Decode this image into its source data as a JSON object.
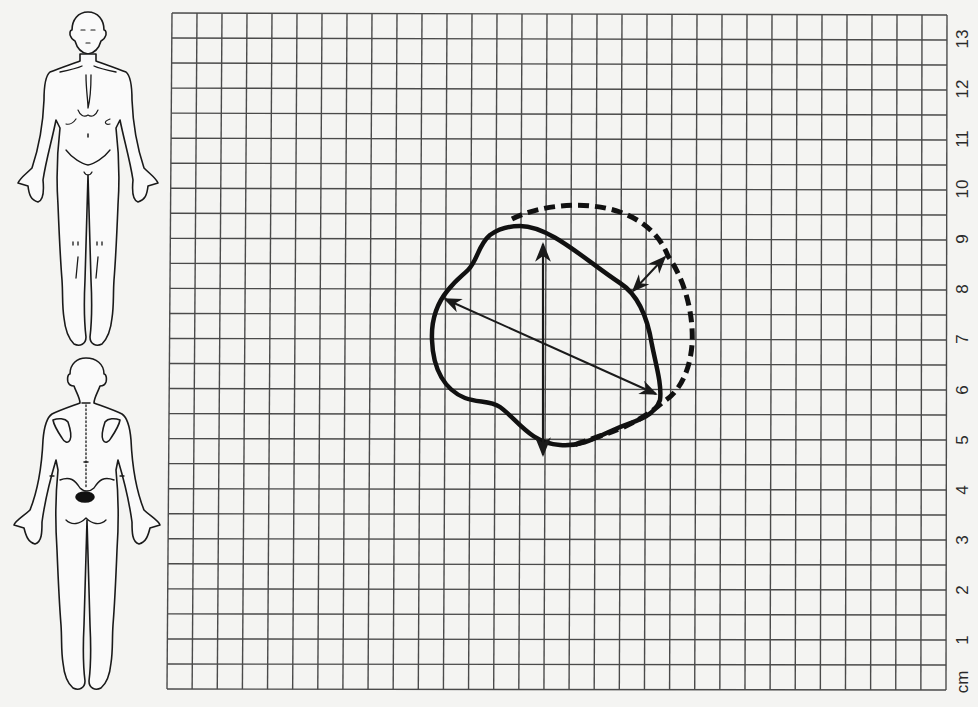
{
  "figure": {
    "unit_label": "cm",
    "scale_labels": [
      "1",
      "2",
      "3",
      "4",
      "5",
      "6",
      "7",
      "8",
      "9",
      "10",
      "11",
      "12",
      "13"
    ],
    "grid": {
      "columns": 31,
      "rows": 27,
      "cell_cm": 0.5
    },
    "colors": {
      "ink": "#1a1a1a",
      "grid_line": "#4a4a4a",
      "paper": "#f4f4f2"
    }
  },
  "body_diagrams": [
    {
      "view": "anterior",
      "marked_region": "none"
    },
    {
      "view": "posterior",
      "marked_region": "lower back / sacral area (filled oval)"
    }
  ],
  "wound": {
    "current_outline_style": "solid",
    "previous_outline_style": "dashed",
    "measurements": [
      {
        "name": "length",
        "style": "vertical double arrow"
      },
      {
        "name": "width",
        "style": "diagonal double arrow"
      },
      {
        "name": "margin change",
        "style": "short double arrow between outlines"
      }
    ]
  }
}
